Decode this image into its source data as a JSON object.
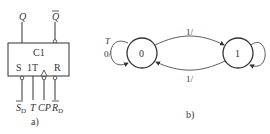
{
  "figure_a": {
    "caption": "a)",
    "block_label": "C1",
    "inputs_inside": {
      "S": "S",
      "T": "1T",
      "R": "R"
    },
    "outputs": {
      "Q": "Q",
      "Q_bar": "Q"
    },
    "pins_bottom": {
      "SD": "S",
      "SD_sub": "D",
      "T": "T",
      "CP": "CP",
      "RD": "R",
      "RD_sub": "D"
    }
  },
  "figure_b": {
    "caption": "b)",
    "states": [
      {
        "label": "0"
      },
      {
        "label": "1"
      }
    ],
    "self_loop_0": {
      "label_top": "T",
      "label_side": "0/"
    },
    "transitions": [
      {
        "from": "0",
        "to": "1",
        "label": "1/"
      },
      {
        "from": "1",
        "to": "0",
        "label": "1/"
      }
    ]
  }
}
